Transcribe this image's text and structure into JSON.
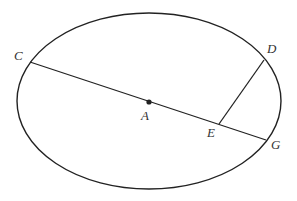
{
  "figure": {
    "stroke_color": "#222222",
    "background": "#ffffff",
    "ellipse": {
      "cx": 149,
      "cy": 101,
      "rx": 132,
      "ry": 88
    },
    "points": {
      "C": {
        "label": "C",
        "x": 30,
        "y": 62,
        "label_x": 14,
        "label_y": 60
      },
      "D": {
        "label": "D",
        "x": 264,
        "y": 60,
        "label_x": 267,
        "label_y": 53
      },
      "A": {
        "label": "A",
        "x": 149,
        "y": 102,
        "label_x": 141,
        "label_y": 120
      },
      "E": {
        "label": "E",
        "x": 219,
        "y": 124,
        "label_x": 207,
        "label_y": 137
      },
      "G": {
        "label": "G",
        "x": 266,
        "y": 140,
        "label_x": 271,
        "label_y": 149
      }
    },
    "segments": [
      {
        "name": "CG",
        "from": "C",
        "to": "G"
      },
      {
        "name": "DE",
        "from": "D",
        "to": "E"
      }
    ]
  }
}
